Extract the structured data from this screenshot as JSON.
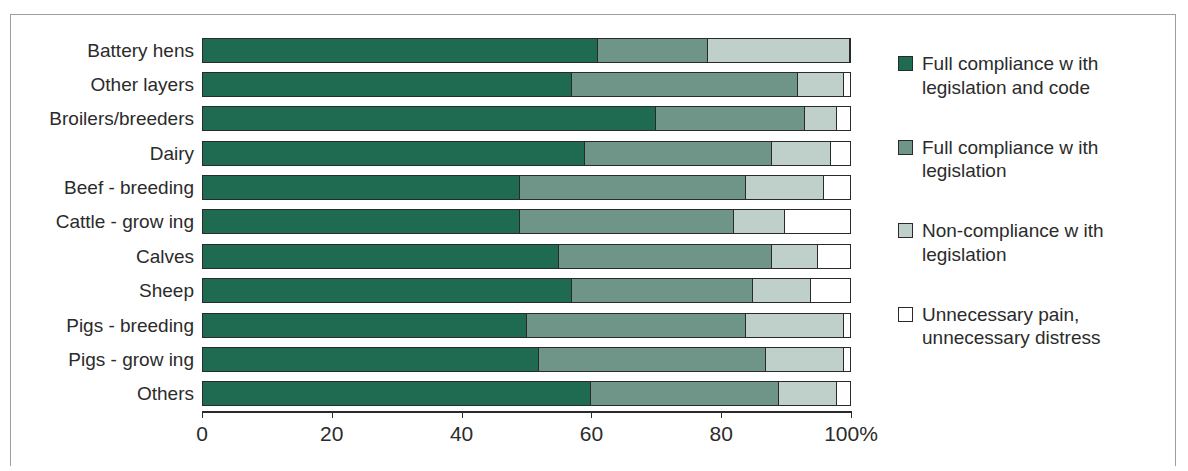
{
  "chart_data": {
    "type": "bar",
    "orientation": "horizontal",
    "stacked": true,
    "normalized_percent": true,
    "title": "",
    "xlabel": "",
    "ylabel": "",
    "xlim": [
      0,
      100
    ],
    "grid": false,
    "legend_position": "right",
    "categories": [
      "Battery hens",
      "Other layers",
      "Broilers/breeders",
      "Dairy",
      "Beef - breeding",
      "Cattle - grow ing",
      "Calves",
      "Sheep",
      "Pigs - breeding",
      "Pigs - grow ing",
      "Others"
    ],
    "series": [
      {
        "name": "Full compliance w ith legislation and code",
        "color": "#1f6b52",
        "values": [
          61,
          57,
          70,
          59,
          49,
          49,
          55,
          57,
          50,
          52,
          60
        ]
      },
      {
        "name": "Full compliance w ith legislation",
        "color": "#6f9588",
        "values": [
          17,
          35,
          23,
          29,
          35,
          33,
          33,
          28,
          34,
          35,
          29
        ]
      },
      {
        "name": "Non-compliance w ith legislation",
        "color": "#bed0c9",
        "values": [
          22,
          7,
          5,
          9,
          12,
          8,
          7,
          9,
          15,
          12,
          9
        ]
      },
      {
        "name": "Unnecessary pain, unnecessary distress",
        "color": "#ffffff",
        "values": [
          0,
          1,
          2,
          3,
          4,
          10,
          5,
          6,
          1,
          1,
          2
        ]
      }
    ],
    "xticks": [
      0,
      20,
      40,
      60,
      80,
      100
    ],
    "xtick_labels": [
      "0",
      "20",
      "40",
      "60",
      "80",
      "100%"
    ]
  },
  "legend": {
    "items": [
      {
        "label": "Full compliance w ith legislation and code",
        "color": "#1f6b52",
        "swatch": "legend-swatch-full-compliance-code"
      },
      {
        "label": "Full compliance w ith legislation",
        "color": "#6f9588",
        "swatch": "legend-swatch-full-compliance"
      },
      {
        "label": "Non-compliance w ith legislation",
        "color": "#bed0c9",
        "swatch": "legend-swatch-non-compliance"
      },
      {
        "label": "Unnecessary pain, unnecessary distress",
        "color": "#ffffff",
        "swatch": "legend-swatch-unnecessary-pain"
      }
    ]
  }
}
